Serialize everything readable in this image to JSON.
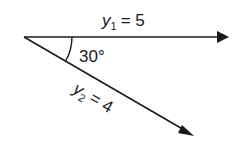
{
  "diagram": {
    "type": "vector-diagram",
    "origin": {
      "x": 24,
      "y": 37
    },
    "vectors": [
      {
        "name": "y1",
        "symbol": "y",
        "subscript": "1",
        "equals": "= 5",
        "magnitude": 5,
        "angle_deg": 0,
        "tip": {
          "x": 228,
          "y": 37
        }
      },
      {
        "name": "y2",
        "symbol": "y",
        "subscript": "2",
        "equals": "= 4",
        "magnitude": 4,
        "angle_deg": -30,
        "tip": {
          "x": 193,
          "y": 135
        }
      }
    ],
    "angle_label": "30°",
    "angle_value": 30,
    "line_color": "#1a1a1a"
  }
}
